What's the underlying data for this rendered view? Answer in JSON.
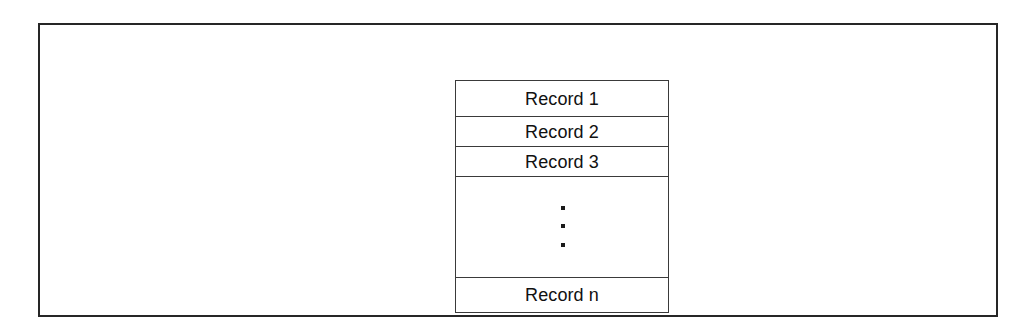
{
  "figure": {
    "background_color": "#ffffff",
    "frame_color": "#262626",
    "table_border_color": "#3a3a3a",
    "text_color": "#111111"
  },
  "record_table": {
    "name": "file-of-records",
    "rows": [
      {
        "label": "Record 1",
        "kind": "record"
      },
      {
        "label": "Record 2",
        "kind": "record"
      },
      {
        "label": "Record 3",
        "kind": "record"
      },
      {
        "label": "",
        "kind": "ellipsis",
        "dots": 3
      },
      {
        "label": "Record n",
        "kind": "record"
      }
    ]
  }
}
